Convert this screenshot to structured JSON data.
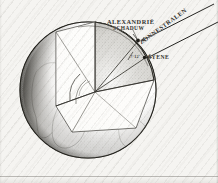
{
  "figure": {
    "kind": "engraved-diagram",
    "background_color": "#f5f4f1",
    "ink_color": "#2b2b27"
  },
  "labels": {
    "alexandria": "ALEXANDRIË",
    "shadow": "SCHADUW",
    "syene": "SYENE",
    "sun_rays": "ZONNESTRALEN",
    "angle": "7°12'"
  },
  "globe": {
    "center_x": 88,
    "center_y": 90,
    "radius": 68,
    "lit_side": "right",
    "shadow_side": "left",
    "continents_visible": "Africa and South America"
  },
  "wedge": {
    "apex_x": 95,
    "apex_y": 92,
    "description": "cut-away sector of the globe showing the angle at the Earth's centre"
  },
  "rays": {
    "count": 2,
    "direction": "from upper right toward lower left",
    "arrowheads": 2
  },
  "markers": {
    "alexandria_point": {
      "x": 138,
      "y": 40
    },
    "syene_point": {
      "x": 144,
      "y": 57
    }
  }
}
